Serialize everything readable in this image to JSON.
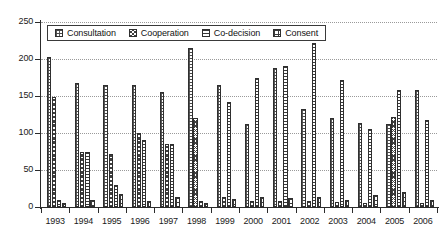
{
  "chart_data": {
    "type": "bar",
    "title": "",
    "subtitle": "",
    "xlabel": "",
    "ylabel": "",
    "ylim": [
      0,
      250
    ],
    "yticks": [
      0,
      50,
      100,
      150,
      200,
      250
    ],
    "grid": true,
    "legend_position": "top-inside",
    "categories": [
      "1993",
      "1994",
      "1995",
      "1996",
      "1997",
      "1998",
      "1999",
      "2000",
      "2001",
      "2002",
      "2003",
      "2004",
      "2005",
      "2006"
    ],
    "series": [
      {
        "name": "Consultation",
        "pattern": "dotted-stipple",
        "values": [
          203,
          167,
          165,
          165,
          155,
          215,
          165,
          112,
          188,
          133,
          120,
          113,
          112,
          158
        ]
      },
      {
        "name": "Cooperation",
        "pattern": "cross-hatch",
        "values": [
          148,
          75,
          72,
          100,
          85,
          120,
          13,
          8,
          8,
          8,
          7,
          6,
          122,
          6
        ]
      },
      {
        "name": "Co-decision",
        "pattern": "horizontal-lines",
        "values": [
          9,
          75,
          30,
          90,
          85,
          8,
          142,
          175,
          190,
          222,
          172,
          105,
          158,
          117
        ]
      },
      {
        "name": "Consent",
        "pattern": "center-dot",
        "values": [
          6,
          10,
          18,
          8,
          14,
          6,
          11,
          13,
          12,
          14,
          10,
          16,
          20,
          10
        ]
      }
    ]
  },
  "legend": {
    "items": [
      {
        "label": "Consultation",
        "swatch": "consultation-swatch-icon"
      },
      {
        "label": "Cooperation",
        "swatch": "cooperation-swatch-icon"
      },
      {
        "label": "Co-decision",
        "swatch": "codecision-swatch-icon"
      },
      {
        "label": "Consent",
        "swatch": "consent-swatch-icon"
      }
    ]
  }
}
